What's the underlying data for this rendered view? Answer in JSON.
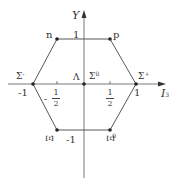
{
  "diagram": {
    "axes": {
      "vertical": {
        "label": "Y"
      },
      "horizontal": {
        "label": "I",
        "subscript": "3"
      }
    },
    "tick_labels": {
      "y_top": "1",
      "y_bottom": "-1",
      "x_left": "-1",
      "x_right": "1",
      "x_half_left_sign": "-",
      "x_half_left_num": "1",
      "x_half_left_den": "2",
      "x_half_right_num": "1",
      "x_half_right_den": "2"
    },
    "particles": [
      {
        "name": "n",
        "I3": -0.5,
        "Y": 1
      },
      {
        "name": "p",
        "I3": 0.5,
        "Y": 1
      },
      {
        "name": "Σ",
        "sup": "-",
        "I3": -1,
        "Y": 0
      },
      {
        "name": "Σ",
        "sup": "+",
        "I3": 1,
        "Y": 0
      },
      {
        "name": "Λ",
        "I3": 0,
        "Y": 0
      },
      {
        "name": "Σ",
        "sup": "0",
        "I3": 0,
        "Y": 0
      },
      {
        "name": "Ξ",
        "sup": "-",
        "I3": -0.5,
        "Y": -1
      },
      {
        "name": "Ξ",
        "sup": "0",
        "I3": 0.5,
        "Y": -1
      }
    ],
    "colors": {
      "line": "#444444",
      "dot": "#222222",
      "text": "#333333"
    }
  }
}
